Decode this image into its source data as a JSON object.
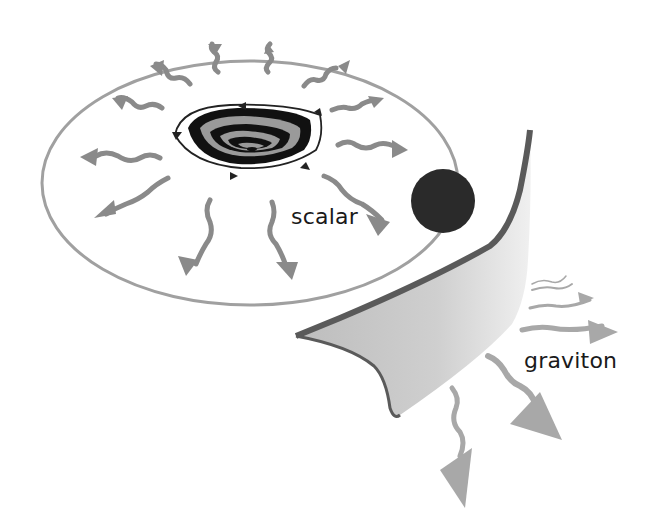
{
  "diagram": {
    "labels": {
      "scalar": "scalar",
      "graviton": "graviton"
    },
    "colors": {
      "background": "#ffffff",
      "disk_outline": "#9a9a9a",
      "arrow": "#8a8a8a",
      "core_dark": "#111111",
      "core_light": "#9a9a9a",
      "compact_object": "#2a2a2a",
      "sheet_fill": "#d4d4d4",
      "sheet_edge": "#555555",
      "graviton_arrow": "#a8a8a8"
    },
    "elements": [
      {
        "name": "accretion-disk",
        "description": "elliptical disk with outward scalar wave arrows"
      },
      {
        "name": "central-core",
        "description": "layered core with circulating flow arrows"
      },
      {
        "name": "compact-object",
        "description": "dark sphere on disk rim"
      },
      {
        "name": "curved-sheet",
        "description": "bent spacetime sheet emitting gravitons"
      }
    ]
  }
}
